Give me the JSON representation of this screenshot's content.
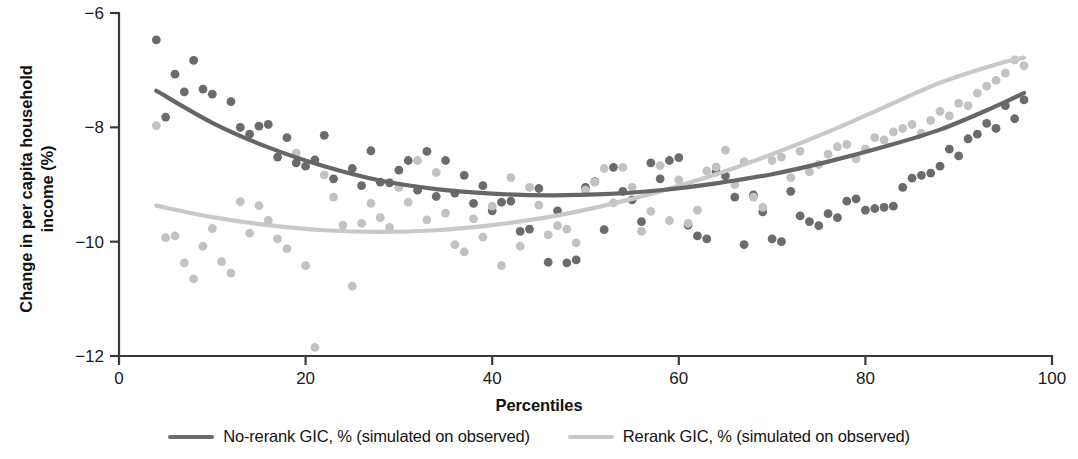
{
  "chart_data": {
    "type": "scatter",
    "title": "",
    "xlabel": "Percentiles",
    "ylabel": "Change in per capita household\nincome (%)",
    "xlim": [
      0,
      100
    ],
    "ylim": [
      -12,
      -6
    ],
    "xticks": [
      0,
      20,
      40,
      60,
      80,
      100
    ],
    "xtick_labels": [
      "0",
      "20",
      "40",
      "60",
      "80",
      "100"
    ],
    "yticks": [
      -6,
      -8,
      -10,
      -12
    ],
    "ytick_labels": [
      "−6",
      "−8",
      "−10",
      "−12"
    ],
    "grid": false,
    "legend_position": "below",
    "colors": {
      "no_rerank": "#6b6b6b",
      "rerank": "#c0c0c0",
      "axis": "#3a3a3a",
      "text": "#1b1b1b"
    },
    "series": [
      {
        "name": "No-rerank GIC, % (simulated on observed)",
        "marker_color": "#6b6b6b",
        "line_color": "#666666",
        "points": [
          [
            4,
            -6.47
          ],
          [
            5,
            -7.82
          ],
          [
            6,
            -7.07
          ],
          [
            7,
            -7.38
          ],
          [
            8,
            -6.83
          ],
          [
            9,
            -7.33
          ],
          [
            10,
            -7.42
          ],
          [
            12,
            -7.55
          ],
          [
            13,
            -8.0
          ],
          [
            14,
            -8.12
          ],
          [
            15,
            -7.98
          ],
          [
            16,
            -7.95
          ],
          [
            17,
            -8.52
          ],
          [
            18,
            -8.18
          ],
          [
            19,
            -8.62
          ],
          [
            20,
            -8.68
          ],
          [
            21,
            -8.57
          ],
          [
            22,
            -8.14
          ],
          [
            23,
            -8.9
          ],
          [
            25,
            -8.72
          ],
          [
            26,
            -9.02
          ],
          [
            27,
            -8.41
          ],
          [
            28,
            -8.96
          ],
          [
            29,
            -8.97
          ],
          [
            30,
            -8.75
          ],
          [
            31,
            -8.58
          ],
          [
            32,
            -9.1
          ],
          [
            33,
            -8.42
          ],
          [
            34,
            -9.21
          ],
          [
            35,
            -8.58
          ],
          [
            36,
            -9.15
          ],
          [
            37,
            -8.84
          ],
          [
            38,
            -9.33
          ],
          [
            39,
            -9.02
          ],
          [
            40,
            -9.46
          ],
          [
            41,
            -9.31
          ],
          [
            42,
            -9.29
          ],
          [
            43,
            -9.82
          ],
          [
            44,
            -9.78
          ],
          [
            45,
            -9.07
          ],
          [
            46,
            -10.36
          ],
          [
            47,
            -9.46
          ],
          [
            48,
            -10.37
          ],
          [
            49,
            -10.32
          ],
          [
            50,
            -9.05
          ],
          [
            51,
            -8.95
          ],
          [
            52,
            -9.79
          ],
          [
            53,
            -8.7
          ],
          [
            54,
            -9.12
          ],
          [
            55,
            -9.27
          ],
          [
            56,
            -9.65
          ],
          [
            57,
            -8.62
          ],
          [
            58,
            -8.9
          ],
          [
            59,
            -8.58
          ],
          [
            60,
            -8.53
          ],
          [
            61,
            -9.71
          ],
          [
            62,
            -9.9
          ],
          [
            63,
            -9.95
          ],
          [
            64,
            -8.78
          ],
          [
            65,
            -8.85
          ],
          [
            66,
            -9.22
          ],
          [
            67,
            -10.05
          ],
          [
            68,
            -9.18
          ],
          [
            69,
            -9.48
          ],
          [
            70,
            -9.95
          ],
          [
            71,
            -10.0
          ],
          [
            72,
            -9.12
          ],
          [
            73,
            -9.55
          ],
          [
            74,
            -9.65
          ],
          [
            75,
            -9.72
          ],
          [
            76,
            -9.51
          ],
          [
            77,
            -9.58
          ],
          [
            78,
            -9.29
          ],
          [
            79,
            -9.25
          ],
          [
            80,
            -9.45
          ],
          [
            81,
            -9.42
          ],
          [
            82,
            -9.4
          ],
          [
            83,
            -9.38
          ],
          [
            84,
            -9.05
          ],
          [
            85,
            -8.89
          ],
          [
            86,
            -8.84
          ],
          [
            87,
            -8.8
          ],
          [
            88,
            -8.68
          ],
          [
            89,
            -8.38
          ],
          [
            90,
            -8.5
          ],
          [
            91,
            -8.2
          ],
          [
            92,
            -8.12
          ],
          [
            93,
            -7.93
          ],
          [
            94,
            -8.02
          ],
          [
            95,
            -7.62
          ],
          [
            96,
            -7.85
          ],
          [
            97,
            -7.52
          ]
        ],
        "trend": [
          [
            4,
            -7.36
          ],
          [
            10,
            -7.92
          ],
          [
            16,
            -8.35
          ],
          [
            22,
            -8.68
          ],
          [
            28,
            -8.93
          ],
          [
            34,
            -9.08
          ],
          [
            40,
            -9.16
          ],
          [
            46,
            -9.19
          ],
          [
            52,
            -9.17
          ],
          [
            58,
            -9.1
          ],
          [
            64,
            -8.98
          ],
          [
            70,
            -8.82
          ],
          [
            76,
            -8.6
          ],
          [
            82,
            -8.34
          ],
          [
            88,
            -8.04
          ],
          [
            94,
            -7.63
          ],
          [
            97,
            -7.4
          ]
        ]
      },
      {
        "name": "Rerank GIC, % (simulated on observed)",
        "marker_color": "#c2c2c2",
        "line_color": "#c8c8c8",
        "points": [
          [
            4,
            -7.97
          ],
          [
            5,
            -9.93
          ],
          [
            6,
            -9.9
          ],
          [
            7,
            -10.37
          ],
          [
            8,
            -10.65
          ],
          [
            9,
            -10.08
          ],
          [
            10,
            -9.77
          ],
          [
            11,
            -10.35
          ],
          [
            12,
            -10.55
          ],
          [
            13,
            -9.3
          ],
          [
            14,
            -9.85
          ],
          [
            15,
            -9.37
          ],
          [
            16,
            -9.63
          ],
          [
            17,
            -9.95
          ],
          [
            18,
            -10.12
          ],
          [
            19,
            -8.45
          ],
          [
            20,
            -10.42
          ],
          [
            21,
            -11.85
          ],
          [
            22,
            -8.83
          ],
          [
            23,
            -9.22
          ],
          [
            24,
            -9.71
          ],
          [
            25,
            -10.78
          ],
          [
            26,
            -9.68
          ],
          [
            27,
            -9.33
          ],
          [
            28,
            -9.58
          ],
          [
            29,
            -9.75
          ],
          [
            30,
            -9.05
          ],
          [
            31,
            -9.31
          ],
          [
            32,
            -8.58
          ],
          [
            33,
            -9.62
          ],
          [
            34,
            -8.79
          ],
          [
            35,
            -9.5
          ],
          [
            36,
            -10.05
          ],
          [
            37,
            -10.18
          ],
          [
            38,
            -9.6
          ],
          [
            39,
            -9.92
          ],
          [
            40,
            -9.38
          ],
          [
            41,
            -10.42
          ],
          [
            42,
            -8.88
          ],
          [
            43,
            -10.08
          ],
          [
            44,
            -9.05
          ],
          [
            45,
            -9.36
          ],
          [
            46,
            -9.88
          ],
          [
            47,
            -9.72
          ],
          [
            48,
            -9.78
          ],
          [
            49,
            -10.02
          ],
          [
            50,
            -9.1
          ],
          [
            51,
            -8.96
          ],
          [
            52,
            -8.72
          ],
          [
            53,
            -9.32
          ],
          [
            54,
            -8.7
          ],
          [
            55,
            -9.05
          ],
          [
            56,
            -9.82
          ],
          [
            57,
            -9.47
          ],
          [
            58,
            -8.67
          ],
          [
            59,
            -9.63
          ],
          [
            60,
            -8.92
          ],
          [
            61,
            -9.68
          ],
          [
            62,
            -9.45
          ],
          [
            63,
            -8.76
          ],
          [
            64,
            -8.69
          ],
          [
            65,
            -8.4
          ],
          [
            66,
            -9.0
          ],
          [
            67,
            -8.6
          ],
          [
            68,
            -9.22
          ],
          [
            69,
            -9.4
          ],
          [
            70,
            -8.58
          ],
          [
            71,
            -8.52
          ],
          [
            72,
            -8.88
          ],
          [
            73,
            -8.42
          ],
          [
            74,
            -8.78
          ],
          [
            75,
            -8.65
          ],
          [
            76,
            -8.47
          ],
          [
            77,
            -8.34
          ],
          [
            78,
            -8.3
          ],
          [
            79,
            -8.55
          ],
          [
            80,
            -8.38
          ],
          [
            81,
            -8.18
          ],
          [
            82,
            -8.22
          ],
          [
            83,
            -8.08
          ],
          [
            84,
            -8.02
          ],
          [
            85,
            -7.95
          ],
          [
            86,
            -8.1
          ],
          [
            87,
            -7.88
          ],
          [
            88,
            -7.72
          ],
          [
            89,
            -7.8
          ],
          [
            90,
            -7.58
          ],
          [
            91,
            -7.62
          ],
          [
            92,
            -7.4
          ],
          [
            93,
            -7.28
          ],
          [
            94,
            -7.18
          ],
          [
            95,
            -7.05
          ],
          [
            96,
            -6.82
          ],
          [
            97,
            -6.92
          ]
        ],
        "trend": [
          [
            4,
            -9.37
          ],
          [
            10,
            -9.57
          ],
          [
            16,
            -9.71
          ],
          [
            22,
            -9.8
          ],
          [
            28,
            -9.83
          ],
          [
            34,
            -9.8
          ],
          [
            40,
            -9.71
          ],
          [
            46,
            -9.57
          ],
          [
            52,
            -9.37
          ],
          [
            58,
            -9.12
          ],
          [
            64,
            -8.82
          ],
          [
            70,
            -8.47
          ],
          [
            76,
            -8.08
          ],
          [
            82,
            -7.65
          ],
          [
            88,
            -7.22
          ],
          [
            94,
            -6.9
          ],
          [
            97,
            -6.78
          ]
        ]
      }
    ]
  },
  "axis": {
    "xlabel": "Percentiles",
    "ylabel_line1": "Change in per capita household",
    "ylabel_line2": "income (%)"
  },
  "legend": {
    "entries": [
      {
        "label": "No-rerank GIC, % (simulated on observed)",
        "color": "#6b6b6b"
      },
      {
        "label": "Rerank GIC, % (simulated on observed)",
        "color": "#c8c8c8"
      }
    ]
  }
}
